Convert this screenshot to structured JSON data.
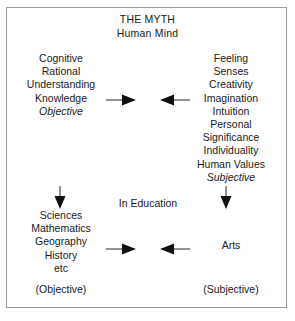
{
  "diagram": {
    "title": {
      "heading": "THE MYTH",
      "subheading": "Human Mind"
    },
    "upper": {
      "left_column": [
        "Cognitive",
        "Rational",
        "Understanding",
        "Knowledge",
        "Objective"
      ],
      "left_column_italic_index": 4,
      "right_column": [
        "Feeling",
        "Senses",
        "Creativity",
        "Imagination",
        "Intuition",
        "Personal",
        "Significance",
        "Individuality",
        "Human Values",
        "Subjective"
      ],
      "right_column_italic_index": 9,
      "converging_arrows": {
        "left_arrow": "arrow-right",
        "right_arrow": "arrow-left"
      }
    },
    "middle_caption": "In Education",
    "transition_arrows": {
      "left": "arrow-down",
      "right": "arrow-down"
    },
    "lower": {
      "left_column": [
        "Sciences",
        "Mathematics",
        "Geography",
        "History",
        "etc"
      ],
      "right_column": [
        "Arts"
      ],
      "converging_arrows": {
        "left_arrow": "arrow-right",
        "right_arrow": "arrow-left"
      },
      "left_label": "(Objective)",
      "right_label": "(Subjective)"
    },
    "colors": {
      "background": "#ffffff",
      "text": "#1a1a1a",
      "frame_border": "#9a9a9a",
      "arrow": "#111111"
    }
  }
}
